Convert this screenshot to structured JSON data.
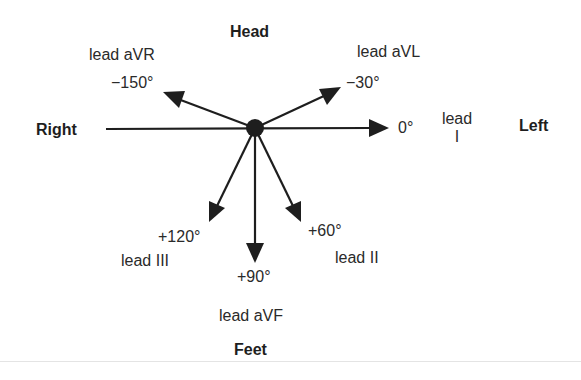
{
  "diagram": {
    "orientation_labels": {
      "top": "Head",
      "bottom": "Feet",
      "left": "Right",
      "right": "Left"
    },
    "leads": [
      {
        "id": "I",
        "name": "lead I",
        "name_lines": [
          "lead",
          "I"
        ],
        "angle_label": "0°",
        "angle_deg": 0
      },
      {
        "id": "aVL",
        "name": "lead aVL",
        "angle_label": "−30°",
        "angle_deg": -30
      },
      {
        "id": "aVR",
        "name": "lead aVR",
        "angle_label": "−150°",
        "angle_deg": -150
      },
      {
        "id": "II",
        "name": "lead II",
        "angle_label": "+60°",
        "angle_deg": 60
      },
      {
        "id": "aVF",
        "name": "lead aVF",
        "angle_label": "+90°",
        "angle_deg": 90
      },
      {
        "id": "III",
        "name": "lead III",
        "angle_label": "+120°",
        "angle_deg": 120
      }
    ],
    "colors": {
      "stroke": "#1e1e1e",
      "text": "#2a2a2a",
      "background": "#ffffff"
    }
  }
}
